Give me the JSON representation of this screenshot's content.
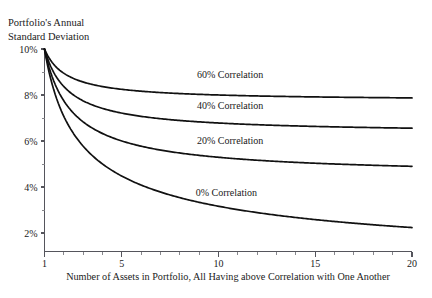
{
  "chart_data": {
    "type": "line",
    "title": "Portfolio's Annual Standard Deviation",
    "title_line1": "Portfolio's Annual",
    "title_line2": "Standard Deviation",
    "xlabel": "Number of Assets in Portfolio, All Having above Correlation with One Another",
    "ylabel": "Portfolio's Annual Standard Deviation",
    "xlim": [
      1,
      20
    ],
    "ylim": [
      1.6,
      10.4
    ],
    "grid": false,
    "legend_position": "inline-annotations",
    "x_ticks_major": [
      1,
      5,
      10,
      15,
      20
    ],
    "x_tick_labels": [
      "1",
      "5",
      "10",
      "15",
      "20"
    ],
    "x_ticks_minor": [
      2,
      3,
      4,
      6,
      7,
      8,
      9,
      11,
      12,
      13,
      14,
      16,
      17,
      18,
      19
    ],
    "y_ticks_major": [
      2,
      4,
      6,
      8,
      10
    ],
    "y_tick_labels": [
      "2%",
      "4%",
      "6%",
      "8%",
      "10%"
    ],
    "y_ticks_minor": [
      3,
      5,
      7,
      9
    ],
    "single_asset_sigma_pct": 10,
    "x": [
      1,
      2,
      3,
      4,
      5,
      6,
      7,
      8,
      9,
      10,
      11,
      12,
      13,
      14,
      15,
      16,
      17,
      18,
      19,
      20
    ],
    "series": [
      {
        "name": "60% Correlation",
        "correlation": 0.6,
        "label": "60% Correlation",
        "label_x": 10.6,
        "label_y_pct": 8.72,
        "values": [
          10.0,
          8.944,
          8.617,
          8.456,
          8.361,
          8.297,
          8.252,
          8.219,
          8.192,
          8.171,
          8.154,
          8.14,
          8.128,
          8.118,
          8.109,
          8.102,
          8.095,
          8.09,
          8.084,
          8.08
        ]
      },
      {
        "name": "40% Correlation",
        "correlation": 0.4,
        "label": "40% Correlation",
        "label_x": 10.6,
        "label_y_pct": 7.38,
        "values": [
          10.0,
          8.367,
          7.817,
          7.55,
          7.39,
          7.303,
          7.223,
          7.168,
          7.125,
          7.089,
          7.06,
          7.036,
          7.016,
          6.998,
          6.983,
          6.969,
          6.957,
          6.947,
          6.937,
          6.928
        ]
      },
      {
        "name": "20% Correlation",
        "correlation": 0.2,
        "label": "20% Correlation",
        "label_x": 10.6,
        "label_y_pct": 5.88,
        "values": [
          10.0,
          7.746,
          6.928,
          6.519,
          6.272,
          6.11,
          5.986,
          5.895,
          5.824,
          5.766,
          5.719,
          5.679,
          5.646,
          5.617,
          5.592,
          5.57,
          5.55,
          5.533,
          5.517,
          5.502
        ]
      },
      {
        "name": "0% Correlation",
        "correlation": 0.0,
        "label": "0% Correlation",
        "label_x": 10.4,
        "label_y_pct": 3.62,
        "values": [
          10.0,
          7.071,
          5.774,
          5.0,
          4.472,
          4.082,
          3.78,
          3.536,
          3.333,
          3.162,
          3.015,
          2.887,
          2.774,
          2.673,
          2.582,
          2.5,
          2.425,
          2.357,
          2.294,
          2.236
        ]
      }
    ]
  }
}
